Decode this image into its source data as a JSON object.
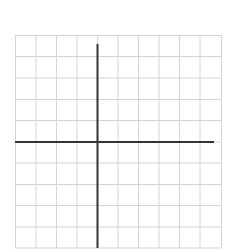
{
  "figure": {
    "type": "coordinate-grid",
    "columns": 10,
    "rows": 10,
    "grid_color": "#d4d4d4",
    "axis_color": "#333333",
    "x_axis_row_index": 5,
    "y_axis_column_index": 4
  }
}
